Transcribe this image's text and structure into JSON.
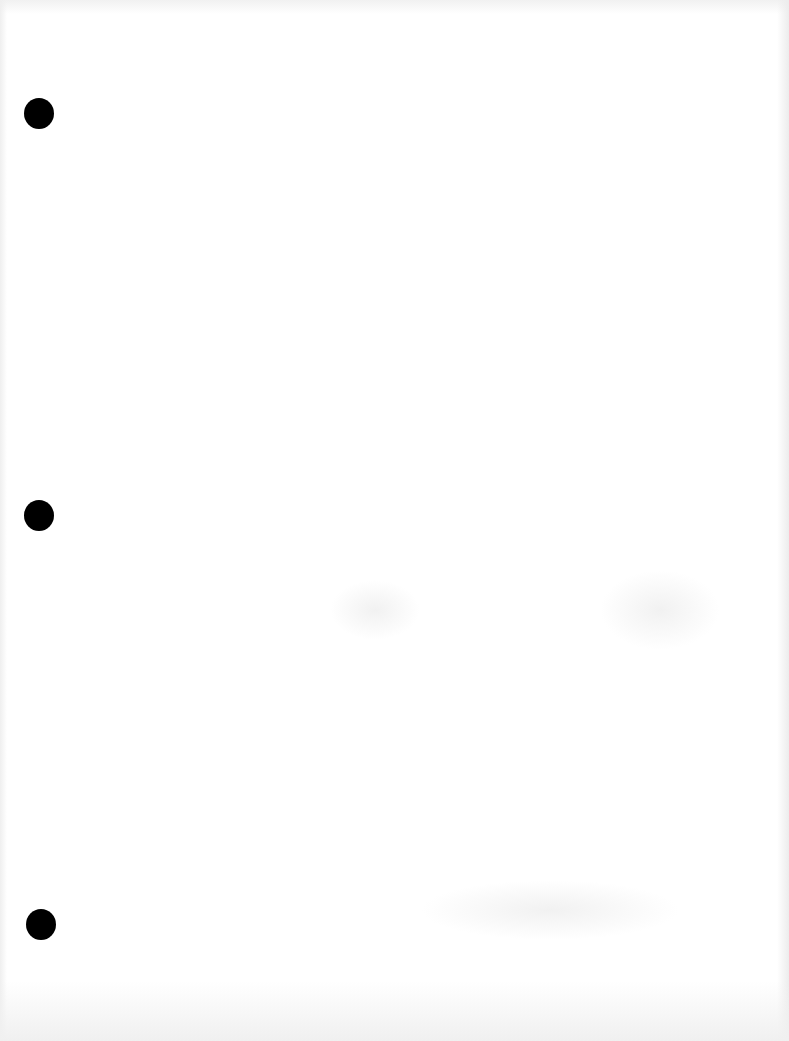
{
  "document": {
    "type": "scanned-blank-page",
    "background_color": "#ffffff",
    "edge_shade_color": "#eeeeee",
    "text": "",
    "punch_holes": [
      {
        "cx": 39,
        "cy": 113,
        "diameter": 30,
        "color": "#000000"
      },
      {
        "cx": 39,
        "cy": 515,
        "diameter": 30,
        "color": "#000000"
      },
      {
        "cx": 41,
        "cy": 924,
        "diameter": 30,
        "color": "#000000"
      }
    ]
  }
}
